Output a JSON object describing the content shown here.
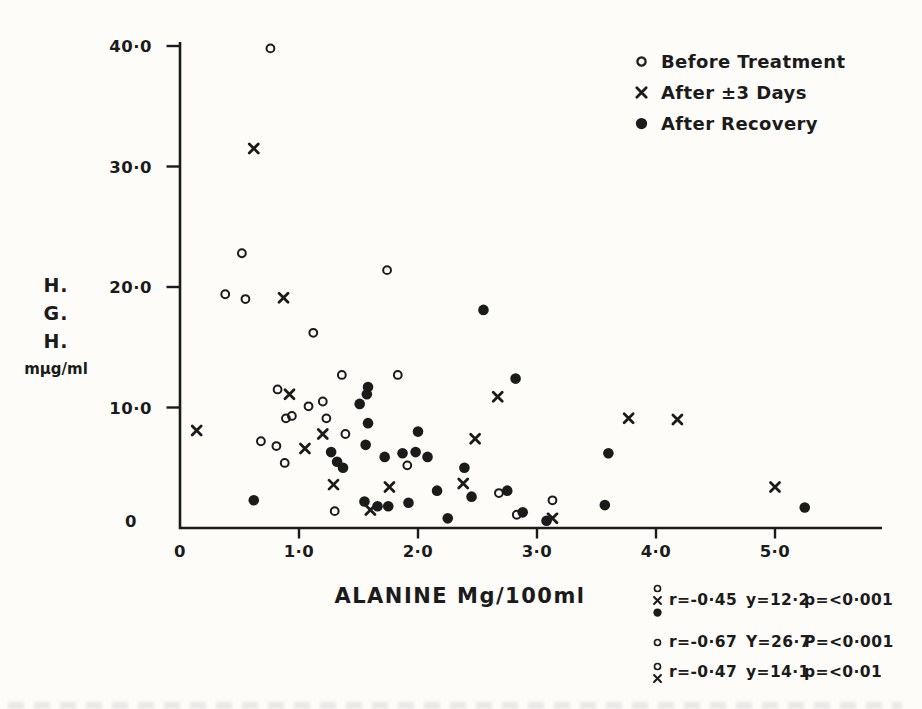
{
  "figure": {
    "bg": "#fdfcf9",
    "ink": "#1b1b1b"
  },
  "legend": {
    "items": [
      {
        "marker": "open-circle",
        "label": "Before Treatment"
      },
      {
        "marker": "x",
        "label": "After ±3 Days"
      },
      {
        "marker": "filled-circle",
        "label": "After Recovery"
      }
    ]
  },
  "axis": {
    "ylabel_lines": [
      "H.",
      "G.",
      "H.",
      "mμg/ml"
    ],
    "xlabel": "ALANINE Mg/100ml"
  },
  "stats": {
    "rows": [
      {
        "markers": [
          "open-circle",
          "x",
          "filled-circle"
        ],
        "r": "r=-0·45",
        "y": "y=12·2",
        "p": "p=<0·001"
      },
      {
        "markers": [
          "open-circle"
        ],
        "r": "r=-0·67",
        "y": "Y=26·7",
        "p": "P=<0·001"
      },
      {
        "markers": [
          "open-circle",
          "x"
        ],
        "r": "r=-0·47",
        "y": "y=14·1",
        "p": "p=<0·01"
      }
    ]
  },
  "chart_data": {
    "type": "scatter",
    "title": "",
    "xlabel": "ALANINE Mg/100ml",
    "ylabel": "H.G.H. mμg/ml",
    "xlim": [
      0,
      5.9
    ],
    "ylim": [
      0,
      40.5
    ],
    "grid": false,
    "legend_position": "top-right",
    "x_ticks": [
      {
        "v": 0,
        "label": "0"
      },
      {
        "v": 1,
        "label": "1·0"
      },
      {
        "v": 2,
        "label": "2·0"
      },
      {
        "v": 3,
        "label": "3·0"
      },
      {
        "v": 4,
        "label": "4·0"
      },
      {
        "v": 5,
        "label": "5·0"
      }
    ],
    "y_ticks": [
      {
        "v": 40,
        "label": "40·0"
      },
      {
        "v": 30,
        "label": "30·0"
      },
      {
        "v": 20,
        "label": "20·0"
      },
      {
        "v": 10,
        "label": "10·0"
      },
      {
        "v": 0,
        "label": "0"
      }
    ],
    "series": [
      {
        "name": "Before Treatment",
        "marker": "open-circle",
        "points": [
          [
            0.76,
            39.8
          ],
          [
            0.52,
            22.8
          ],
          [
            1.74,
            21.4
          ],
          [
            0.38,
            19.4
          ],
          [
            0.55,
            19.0
          ],
          [
            1.12,
            16.2
          ],
          [
            1.36,
            12.7
          ],
          [
            1.83,
            12.7
          ],
          [
            0.82,
            11.5
          ],
          [
            1.2,
            10.5
          ],
          [
            1.08,
            10.1
          ],
          [
            0.89,
            9.1
          ],
          [
            0.94,
            9.3
          ],
          [
            1.23,
            9.1
          ],
          [
            1.39,
            7.8
          ],
          [
            0.68,
            7.2
          ],
          [
            0.81,
            6.8
          ],
          [
            0.88,
            5.4
          ],
          [
            1.91,
            5.2
          ],
          [
            2.68,
            2.9
          ],
          [
            3.13,
            2.3
          ],
          [
            2.83,
            1.1
          ],
          [
            1.3,
            1.4
          ]
        ]
      },
      {
        "name": "After ±3 Days",
        "marker": "x",
        "points": [
          [
            0.62,
            31.5
          ],
          [
            0.87,
            19.1
          ],
          [
            0.14,
            8.1
          ],
          [
            0.92,
            11.1
          ],
          [
            1.2,
            7.8
          ],
          [
            1.05,
            6.6
          ],
          [
            1.29,
            3.6
          ],
          [
            1.76,
            3.4
          ],
          [
            1.6,
            1.5
          ],
          [
            2.67,
            10.9
          ],
          [
            2.48,
            7.4
          ],
          [
            2.38,
            3.7
          ],
          [
            3.13,
            0.8
          ],
          [
            3.77,
            9.1
          ],
          [
            4.18,
            9.0
          ],
          [
            5.0,
            3.4
          ]
        ]
      },
      {
        "name": "After Recovery",
        "marker": "filled-circle",
        "points": [
          [
            2.55,
            18.1
          ],
          [
            2.82,
            12.4
          ],
          [
            1.58,
            11.7
          ],
          [
            1.57,
            11.1
          ],
          [
            1.51,
            10.3
          ],
          [
            1.58,
            8.7
          ],
          [
            2.0,
            8.0
          ],
          [
            1.56,
            6.9
          ],
          [
            1.27,
            6.3
          ],
          [
            1.32,
            5.5
          ],
          [
            1.37,
            5.0
          ],
          [
            1.72,
            5.9
          ],
          [
            1.87,
            6.2
          ],
          [
            1.98,
            6.3
          ],
          [
            2.08,
            5.9
          ],
          [
            2.39,
            5.0
          ],
          [
            2.16,
            3.1
          ],
          [
            2.45,
            2.6
          ],
          [
            2.75,
            3.1
          ],
          [
            2.88,
            1.3
          ],
          [
            2.25,
            0.8
          ],
          [
            3.08,
            0.6
          ],
          [
            3.6,
            6.2
          ],
          [
            3.57,
            1.9
          ],
          [
            0.62,
            2.3
          ],
          [
            1.55,
            2.2
          ],
          [
            1.66,
            1.8
          ],
          [
            1.75,
            1.8
          ],
          [
            1.92,
            2.1
          ],
          [
            5.25,
            1.7
          ]
        ]
      }
    ]
  }
}
